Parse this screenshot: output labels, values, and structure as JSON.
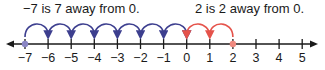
{
  "captions": {
    "negative": "−7 is 7 away from 0.",
    "positive": "2 is 2 away from 0."
  },
  "number_line": {
    "min": -7,
    "max": 5,
    "ticks": [
      "−7",
      "−6",
      "−5",
      "−4",
      "−3",
      "−2",
      "−1",
      "0",
      "1",
      "2",
      "3",
      "4",
      "5"
    ],
    "highlighted_points": [
      {
        "value": -7,
        "color": "#8a86c4"
      },
      {
        "value": 2,
        "color": "#ef8a80"
      }
    ],
    "jumps_negative": {
      "from": -7,
      "to": 0,
      "count": 7,
      "color": "#3d3f8f"
    },
    "jumps_positive": {
      "from": 2,
      "to": 0,
      "count": 2,
      "color": "#e5534b"
    },
    "axis_color": "#1a1a1a"
  }
}
